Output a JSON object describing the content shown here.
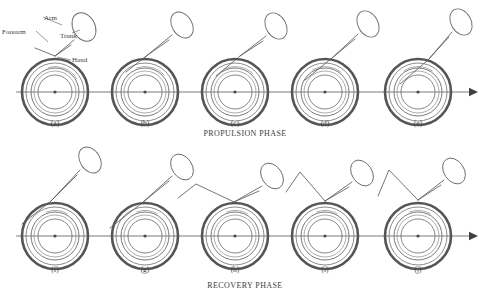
{
  "figure": {
    "background_color": "#ffffff",
    "stroke_color": "#555555",
    "rows": [
      {
        "id": "propulsion",
        "phase_label": "PROPULSION PHASE",
        "phase_label_x": 245,
        "phase_label_y": 136,
        "axle_y": 92,
        "arrow_end_x": 478,
        "panels": [
          {
            "id": "a",
            "label": "(a)",
            "cx": 55,
            "cy": 92,
            "label_y": 126,
            "hand_angle_deg": 285,
            "arm": [
              [
                55,
                56
              ],
              [
                74,
                40
              ]
            ],
            "trunk_cx": 84,
            "trunk_cy": 27,
            "trunk_rx": 11,
            "trunk_ry": 15,
            "trunk_rot": -28,
            "forearm": [
              [
                55,
                56
              ],
              [
                35,
                48
              ]
            ],
            "elbow": null,
            "stroke_arc_start_deg": 255,
            "stroke_arc_end_deg": 330,
            "annotated": true
          },
          {
            "id": "b",
            "label": "(b)",
            "cx": 145,
            "cy": 92,
            "label_y": 126,
            "hand_angle_deg": 290,
            "arm": [
              [
                145,
                57
              ],
              [
                172,
                35
              ]
            ],
            "trunk_cx": 182,
            "trunk_cy": 25,
            "trunk_rx": 10,
            "trunk_ry": 14,
            "trunk_rot": -32,
            "forearm": [
              [
                145,
                57
              ],
              [
                126,
                72
              ]
            ],
            "elbow": null,
            "stroke_arc_start_deg": 250,
            "stroke_arc_end_deg": 320,
            "annotated": false
          },
          {
            "id": "c",
            "label": "(c)",
            "cx": 235,
            "cy": 92,
            "label_y": 126,
            "hand_angle_deg": 300,
            "arm": [
              [
                240,
                56
              ],
              [
                266,
                36
              ]
            ],
            "trunk_cx": 276,
            "trunk_cy": 26,
            "trunk_rx": 10,
            "trunk_ry": 14,
            "trunk_rot": -30,
            "forearm": [
              [
                240,
                56
              ],
              [
                216,
                76
              ]
            ],
            "elbow": null,
            "stroke_arc_start_deg": 245,
            "stroke_arc_end_deg": 315,
            "annotated": false
          },
          {
            "id": "d",
            "label": "(d)",
            "cx": 325,
            "cy": 92,
            "label_y": 126,
            "hand_angle_deg": 305,
            "arm": [
              [
                332,
                58
              ],
              [
                358,
                34
              ]
            ],
            "trunk_cx": 368,
            "trunk_cy": 24,
            "trunk_rx": 10,
            "trunk_ry": 14,
            "trunk_rot": -30,
            "forearm": [
              [
                332,
                58
              ],
              [
                305,
                80
              ]
            ],
            "elbow": null,
            "stroke_arc_start_deg": 240,
            "stroke_arc_end_deg": 310,
            "annotated": false
          },
          {
            "id": "e",
            "label": "(e)",
            "cx": 418,
            "cy": 92,
            "label_y": 126,
            "hand_angle_deg": 312,
            "arm": [
              [
                428,
                60
              ],
              [
                452,
                32
              ]
            ],
            "trunk_cx": 461,
            "trunk_cy": 22,
            "trunk_rx": 10,
            "trunk_ry": 14,
            "trunk_rot": -30,
            "forearm": [
              [
                428,
                60
              ],
              [
                400,
                84
              ]
            ],
            "elbow": null,
            "stroke_arc_start_deg": 235,
            "stroke_arc_end_deg": 305,
            "annotated": false
          }
        ]
      },
      {
        "id": "recovery",
        "phase_label": "RECOVERY PHASE",
        "phase_label_x": 245,
        "phase_label_y": 288,
        "axle_y": 236,
        "arrow_end_x": 478,
        "panels": [
          {
            "id": "f",
            "label": "(f)",
            "cx": 55,
            "cy": 236,
            "label_y": 272,
            "hand_angle_deg": 295,
            "arm": [
              [
                51,
                201
              ],
              [
                80,
                170
              ]
            ],
            "trunk_cx": 90,
            "trunk_cy": 160,
            "trunk_rx": 10,
            "trunk_ry": 14,
            "trunk_rot": -32,
            "forearm": [
              [
                51,
                201
              ],
              [
                22,
                224
              ]
            ],
            "elbow": null,
            "stroke_arc_start_deg": 250,
            "stroke_arc_end_deg": 300,
            "annotated": false
          },
          {
            "id": "g",
            "label": "(g)",
            "cx": 145,
            "cy": 236,
            "label_y": 272,
            "hand_angle_deg": 292,
            "arm": [
              [
                142,
                203
              ],
              [
                172,
                176
              ]
            ],
            "trunk_cx": 182,
            "trunk_cy": 167,
            "trunk_rx": 10,
            "trunk_ry": 14,
            "trunk_rot": -34,
            "forearm": [
              [
                142,
                203
              ],
              [
                110,
                228
              ]
            ],
            "elbow": null,
            "stroke_arc_start_deg": 250,
            "stroke_arc_end_deg": 300,
            "annotated": false
          },
          {
            "id": "h",
            "label": "(h)",
            "cx": 235,
            "cy": 236,
            "label_y": 272,
            "hand_angle_deg": 290,
            "arm": [
              [
                234,
                202
              ],
              [
                262,
                186
              ]
            ],
            "trunk_cx": 272,
            "trunk_cy": 176,
            "trunk_rx": 10,
            "trunk_ry": 14,
            "trunk_rot": -34,
            "forearm": [
              [
                234,
                202
              ],
              [
                196,
                184
              ]
            ],
            "elbow": [
              196,
              184
            ],
            "elbow2": [
              178,
              198
            ],
            "stroke_arc_start_deg": 250,
            "stroke_arc_end_deg": 300,
            "annotated": false
          },
          {
            "id": "i",
            "label": "(i)",
            "cx": 325,
            "cy": 236,
            "label_y": 272,
            "hand_angle_deg": 288,
            "arm": [
              [
                325,
                201
              ],
              [
                352,
                182
              ]
            ],
            "trunk_cx": 362,
            "trunk_cy": 173,
            "trunk_rx": 10,
            "trunk_ry": 14,
            "trunk_rot": -34,
            "forearm": [
              [
                325,
                201
              ],
              [
                300,
                172
              ]
            ],
            "elbow": [
              300,
              172
            ],
            "elbow2": [
              286,
              192
            ],
            "stroke_arc_start_deg": 250,
            "stroke_arc_end_deg": 300,
            "annotated": false
          },
          {
            "id": "j",
            "label": "(j)",
            "cx": 418,
            "cy": 236,
            "label_y": 272,
            "hand_angle_deg": 286,
            "arm": [
              [
                418,
                200
              ],
              [
                444,
                180
              ]
            ],
            "trunk_cx": 454,
            "trunk_cy": 171,
            "trunk_rx": 10,
            "trunk_ry": 14,
            "trunk_rot": -34,
            "forearm": [
              [
                418,
                200
              ],
              [
                389,
                170
              ]
            ],
            "elbow": [
              389,
              170
            ],
            "elbow2": [
              378,
              196
            ],
            "stroke_arc_start_deg": 250,
            "stroke_arc_end_deg": 300,
            "annotated": false
          }
        ]
      }
    ],
    "wheel": {
      "tire_radius": 33,
      "tire_inner_radius": 29,
      "handrim_radius": 24,
      "handrim2_radius": 21,
      "hub_radius": 17,
      "hub_dot_radius": 1.6
    },
    "annotations": [
      {
        "id": "arm",
        "label": "Arm",
        "text_x": 44,
        "text_y": 20,
        "anchor": "start",
        "leader": [
          [
            43,
            17
          ],
          [
            62,
            25
          ]
        ]
      },
      {
        "id": "forearm",
        "label": "Forearm",
        "text_x": 2,
        "text_y": 34,
        "anchor": "start",
        "leader": [
          [
            36,
            31
          ],
          [
            48,
            42
          ]
        ]
      },
      {
        "id": "trunk",
        "label": "Trunk",
        "text_x": 60,
        "text_y": 38,
        "anchor": "start",
        "leader": [
          [
            72,
            33
          ],
          [
            80,
            30
          ]
        ]
      },
      {
        "id": "hand",
        "label": "Hand",
        "text_x": 72,
        "text_y": 62,
        "anchor": "start",
        "leader": [
          [
            71,
            60
          ],
          [
            57,
            57
          ]
        ]
      }
    ]
  }
}
